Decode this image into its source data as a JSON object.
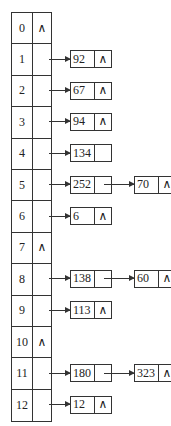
{
  "null_symbol": "∧",
  "buckets": [
    {
      "index": "0",
      "ptr": "∧",
      "chain": []
    },
    {
      "index": "1",
      "ptr": "",
      "chain": [
        {
          "value": "92",
          "next": "∧"
        }
      ]
    },
    {
      "index": "2",
      "ptr": "",
      "chain": [
        {
          "value": "67",
          "next": "∧"
        }
      ]
    },
    {
      "index": "3",
      "ptr": "",
      "chain": [
        {
          "value": "94",
          "next": "∧"
        }
      ]
    },
    {
      "index": "4",
      "ptr": "",
      "chain": [
        {
          "value": "134",
          "next": ""
        }
      ]
    },
    {
      "index": "5",
      "ptr": "",
      "chain": [
        {
          "value": "252",
          "next": ""
        },
        {
          "value": "70",
          "next": "∧"
        }
      ]
    },
    {
      "index": "6",
      "ptr": "",
      "chain": [
        {
          "value": "6",
          "next": "∧"
        }
      ]
    },
    {
      "index": "7",
      "ptr": "∧",
      "chain": []
    },
    {
      "index": "8",
      "ptr": "",
      "chain": [
        {
          "value": "138",
          "next": ""
        },
        {
          "value": "60",
          "next": "∧"
        }
      ]
    },
    {
      "index": "9",
      "ptr": "",
      "chain": [
        {
          "value": "113",
          "next": "∧"
        }
      ]
    },
    {
      "index": "10",
      "ptr": "∧",
      "chain": []
    },
    {
      "index": "11",
      "ptr": "",
      "chain": [
        {
          "value": "180",
          "next": ""
        },
        {
          "value": "323",
          "next": "∧"
        }
      ]
    },
    {
      "index": "12",
      "ptr": "",
      "chain": [
        {
          "value": "12",
          "next": "∧"
        }
      ]
    }
  ]
}
